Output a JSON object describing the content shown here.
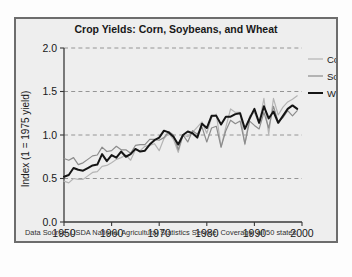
{
  "figure": {
    "background_color": "#eeeeee",
    "frame_color": "#6d6d6d",
    "footer": "Data Source:  USDA National Agricultural Statistics Service.  Coverage: all 50 states."
  },
  "chart_data": {
    "type": "line",
    "title": "Crop Yields: Corn, Soybeans, and Wheat",
    "xlabel": "",
    "ylabel": "Index (1 = 1975 yield)",
    "xlim": [
      1950,
      2000
    ],
    "ylim": [
      0.0,
      2.0
    ],
    "xticks": [
      1950,
      1960,
      1970,
      1980,
      1990,
      2000
    ],
    "xtick_labels": [
      "1950",
      "1960",
      "1970",
      "1980",
      "1990",
      "2000"
    ],
    "yticks": [
      0.0,
      0.5,
      1.0,
      1.5,
      2.0
    ],
    "ytick_labels": [
      "0.0",
      "0.5",
      "1.0",
      "1.5",
      "2.0"
    ],
    "grid": "horizontal-dashed",
    "grid_color": "#8a8a8a",
    "legend_position": "right-top",
    "x": [
      1950,
      1951,
      1952,
      1953,
      1954,
      1955,
      1956,
      1957,
      1958,
      1959,
      1960,
      1961,
      1962,
      1963,
      1964,
      1965,
      1966,
      1967,
      1968,
      1969,
      1970,
      1971,
      1972,
      1973,
      1974,
      1975,
      1976,
      1977,
      1978,
      1979,
      1980,
      1981,
      1982,
      1983,
      1984,
      1985,
      1986,
      1987,
      1988,
      1989,
      1990,
      1991,
      1992,
      1993,
      1994,
      1995,
      1996,
      1997,
      1998,
      1999
    ],
    "series": [
      {
        "name": "Corn",
        "color": "#b4b4b4",
        "width": 1.2,
        "values": [
          0.47,
          0.45,
          0.5,
          0.49,
          0.49,
          0.53,
          0.57,
          0.58,
          0.64,
          0.65,
          0.68,
          0.72,
          0.74,
          0.77,
          0.71,
          0.83,
          0.82,
          0.87,
          0.88,
          0.9,
          0.82,
          0.96,
          1.02,
          0.95,
          0.8,
          1.0,
          0.98,
          1.03,
          1.09,
          1.15,
          1.02,
          1.2,
          1.24,
          0.86,
          1.09,
          1.3,
          1.26,
          1.26,
          0.89,
          1.22,
          1.26,
          1.13,
          1.42,
          1.01,
          1.42,
          1.23,
          1.32,
          1.38,
          1.41,
          1.45
        ]
      },
      {
        "name": "Soybeans",
        "color": "#8c8c8c",
        "width": 1.2,
        "values": [
          0.73,
          0.71,
          0.74,
          0.66,
          0.68,
          0.72,
          0.76,
          0.77,
          0.86,
          0.81,
          0.82,
          0.87,
          0.83,
          0.83,
          0.79,
          0.88,
          0.89,
          0.89,
          0.95,
          0.95,
          0.94,
          0.97,
          1.04,
          1.0,
          0.83,
          1.0,
          0.92,
          1.05,
          1.01,
          1.09,
          0.92,
          1.08,
          1.1,
          0.86,
          1.05,
          1.17,
          1.13,
          1.16,
          0.9,
          1.16,
          1.11,
          1.07,
          1.26,
          1.08,
          1.33,
          1.15,
          1.2,
          1.28,
          1.22,
          1.28
        ]
      },
      {
        "name": "Wheat",
        "color": "#151515",
        "width": 2.0,
        "values": [
          0.52,
          0.54,
          0.62,
          0.6,
          0.59,
          0.62,
          0.65,
          0.66,
          0.78,
          0.7,
          0.77,
          0.74,
          0.81,
          0.75,
          0.78,
          0.84,
          0.81,
          0.82,
          0.89,
          0.94,
          0.97,
          1.05,
          1.03,
          0.98,
          0.89,
          1.0,
          1.04,
          1.02,
          0.97,
          1.13,
          1.08,
          1.22,
          1.22,
          1.12,
          1.21,
          1.21,
          1.24,
          1.25,
          1.07,
          1.19,
          1.3,
          1.14,
          1.33,
          1.19,
          1.27,
          1.14,
          1.22,
          1.3,
          1.34,
          1.3
        ]
      }
    ]
  }
}
